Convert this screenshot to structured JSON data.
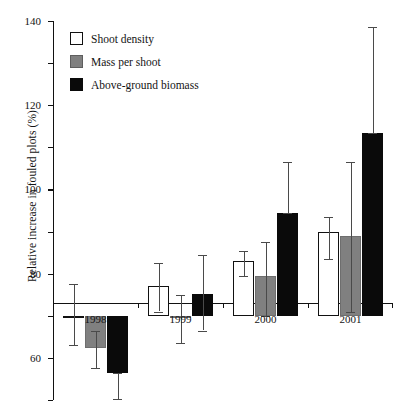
{
  "chart_data": {
    "type": "bar",
    "title": "",
    "subtitle": "",
    "xlabel": "",
    "ylabel": "Relative increase in fouled plots (%)",
    "categories": [
      "1998",
      "1999",
      "2000",
      "2001"
    ],
    "ylim": [
      -40,
      140
    ],
    "ytick_step": 20,
    "yticks": [
      140,
      120,
      100,
      80,
      60,
      40,
      20,
      0,
      -20,
      -40
    ],
    "ytick_labels": [
      "140",
      "120",
      "100",
      "80",
      "60",
      "40",
      "20",
      "0",
      "-20",
      "-40"
    ],
    "grid": false,
    "legend_position": "top-left",
    "zero_reference_line": 0,
    "error_bar_type": "standard error",
    "series": [
      {
        "name": "Shoot density",
        "color": "#ffffff",
        "edge_color": "#111111",
        "values": [
          0,
          14,
          26,
          40
        ],
        "err_low": [
          -14,
          2,
          19,
          27
        ],
        "err_high": [
          15,
          25,
          31,
          47
        ]
      },
      {
        "name": "Mass per shoot",
        "color": "#808080",
        "edge_color": "#6e6e6e",
        "values": [
          -15.5,
          -0.5,
          19,
          38
        ],
        "err_low": [
          -25,
          -13,
          0,
          2
        ],
        "err_high": [
          -7,
          10,
          35,
          73
        ]
      },
      {
        "name": "Above-ground biomass",
        "color": "#0a0a0a",
        "edge_color": "#0a0a0a",
        "values": [
          -27,
          10.5,
          49,
          87
        ],
        "err_low": [
          -39.5,
          -7,
          49,
          87
        ],
        "err_high": [
          -27,
          29,
          73,
          137
        ]
      }
    ]
  },
  "legend": {
    "items": [
      {
        "label": "Shoot density",
        "swatch": "white"
      },
      {
        "label": "Mass per shoot",
        "swatch": "gray"
      },
      {
        "label": "Above-ground biomass",
        "swatch": "black"
      }
    ]
  },
  "axis": {
    "y_title": "Relative increase in fouled plots (%)"
  },
  "artifact": {
    "top_partial_text": ""
  }
}
